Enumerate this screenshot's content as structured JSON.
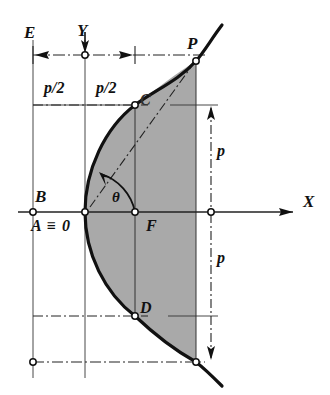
{
  "figure": {
    "background": "#ffffff",
    "fill_color": "#a8a8a8",
    "line_color": "#1a1a1a",
    "axes": {
      "x_label": "X",
      "y_label": "Y",
      "x_axis_y": 212,
      "y_axis_x": 85,
      "origin_label": "A ≡ 0"
    },
    "points": [
      {
        "name": "E",
        "label": "E",
        "x": 28,
        "y": 32
      },
      {
        "name": "Y",
        "label": "Y",
        "x": 81,
        "y": 30
      },
      {
        "name": "P",
        "label": "P",
        "x": 191,
        "y": 43
      },
      {
        "name": "C",
        "label": "C",
        "x": 144,
        "y": 100
      },
      {
        "name": "B",
        "label": "B",
        "x": 39,
        "y": 196
      },
      {
        "name": "A",
        "label": "A ≡ 0",
        "x": 35,
        "y": 226
      },
      {
        "name": "theta",
        "label": "θ",
        "x": 116,
        "y": 198
      },
      {
        "name": "F",
        "label": "F",
        "x": 150,
        "y": 226
      },
      {
        "name": "D",
        "label": "D",
        "x": 144,
        "y": 308
      },
      {
        "name": "X",
        "label": "X",
        "x": 307,
        "y": 201
      }
    ],
    "dimensions": [
      {
        "name": "half-p-left",
        "label": "p/2",
        "x": 52,
        "y": 88
      },
      {
        "name": "half-p-right",
        "label": "p/2",
        "x": 104,
        "y": 88
      },
      {
        "name": "p-upper",
        "label": "p",
        "x": 221,
        "y": 151
      },
      {
        "name": "p-lower",
        "label": "p",
        "x": 221,
        "y": 258
      }
    ],
    "curve": {
      "type": "parabola",
      "equation": "y^2 = 2 p x",
      "vertex": {
        "x": 85,
        "y": 212
      },
      "opens": "right",
      "focus": {
        "x": 135,
        "y": 212
      },
      "directrix_x": 33,
      "latus_rectum_top": {
        "x": 135,
        "y": 105
      },
      "latus_rectum_bottom": {
        "x": 135,
        "y": 316
      }
    },
    "markers": {
      "circle_radius": 3,
      "circle_fill": "#ffffff"
    }
  }
}
